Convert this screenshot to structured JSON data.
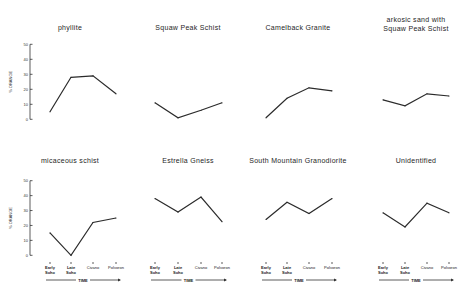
{
  "chart_data": [
    {
      "type": "line",
      "title": "phyllite",
      "categories": [
        "Early Soho",
        "Late Soho",
        "Civano",
        "Polvoron"
      ],
      "values": [
        5,
        28,
        29,
        17
      ],
      "ylabel": "% ORANGE",
      "xlabel": "",
      "ylim": [
        0,
        50
      ],
      "yticks": [
        "0",
        "10",
        "20",
        "30",
        "40",
        "50"
      ],
      "show_y_axis": true,
      "show_x_labels": false
    },
    {
      "type": "line",
      "title": "Squaw Peak Schist",
      "categories": [
        "Early Soho",
        "Late Soho",
        "Civano",
        "Polvoron"
      ],
      "values": [
        11,
        1,
        6,
        11
      ],
      "ylim": [
        0,
        50
      ],
      "show_y_axis": false,
      "show_x_labels": false
    },
    {
      "type": "line",
      "title": "Camelback Granite",
      "categories": [
        "Early Soho",
        "Late Soho",
        "Civano",
        "Polvoron"
      ],
      "values": [
        1,
        14,
        21,
        19
      ],
      "ylim": [
        0,
        50
      ],
      "show_y_axis": false,
      "show_x_labels": false
    },
    {
      "type": "line",
      "title": "arkosic sand with",
      "title_line2": "Squaw Peak Schist",
      "categories": [
        "Early Soho",
        "Late Soho",
        "Civano",
        "Polvoron"
      ],
      "values": [
        13,
        9,
        17,
        15.5
      ],
      "ylim": [
        0,
        50
      ],
      "show_y_axis": false,
      "show_x_labels": false
    },
    {
      "type": "line",
      "title": "micaceous schist",
      "categories": [
        "Early Soho",
        "Late Soho",
        "Civano",
        "Polvoron"
      ],
      "values": [
        15,
        0,
        22,
        25
      ],
      "ylabel": "% ORANGE",
      "xlabel": "TIME",
      "ylim": [
        0,
        50
      ],
      "yticks": [
        "0",
        "10",
        "20",
        "30",
        "40",
        "50"
      ],
      "show_y_axis": true,
      "show_x_labels": true
    },
    {
      "type": "line",
      "title": "Estrella Gneiss",
      "categories": [
        "Early Soho",
        "Late Soho",
        "Civano",
        "Polvoron"
      ],
      "values": [
        38,
        29,
        39,
        22.5
      ],
      "xlabel": "TIME",
      "ylim": [
        0,
        50
      ],
      "show_y_axis": false,
      "show_x_labels": true
    },
    {
      "type": "line",
      "title": "South Mountain Granodiorite",
      "categories": [
        "Early Soho",
        "Late Soho",
        "Civano",
        "Polvoron"
      ],
      "values": [
        24,
        35.5,
        28,
        38
      ],
      "xlabel": "TIME",
      "ylim": [
        0,
        50
      ],
      "show_y_axis": false,
      "show_x_labels": true
    },
    {
      "type": "line",
      "title": "Unidentified",
      "categories": [
        "Early Soho",
        "Late Soho",
        "Civano",
        "Polvoron"
      ],
      "values": [
        28.5,
        19,
        35,
        28.5
      ],
      "xlabel": "TIME",
      "ylim": [
        0,
        50
      ],
      "show_y_axis": false,
      "show_x_labels": true
    }
  ],
  "category_display": [
    {
      "line1": "Early",
      "line2": "Soho",
      "bold": true
    },
    {
      "line1": "Late",
      "line2": "Soho",
      "bold": true
    },
    {
      "line1": "Civano",
      "line2": "",
      "bold": false
    },
    {
      "line1": "Polvoron",
      "line2": "",
      "bold": false
    }
  ],
  "colors": {
    "line": "#2b2b2b",
    "background": "#ffffff",
    "text": "#1e1e1e"
  }
}
